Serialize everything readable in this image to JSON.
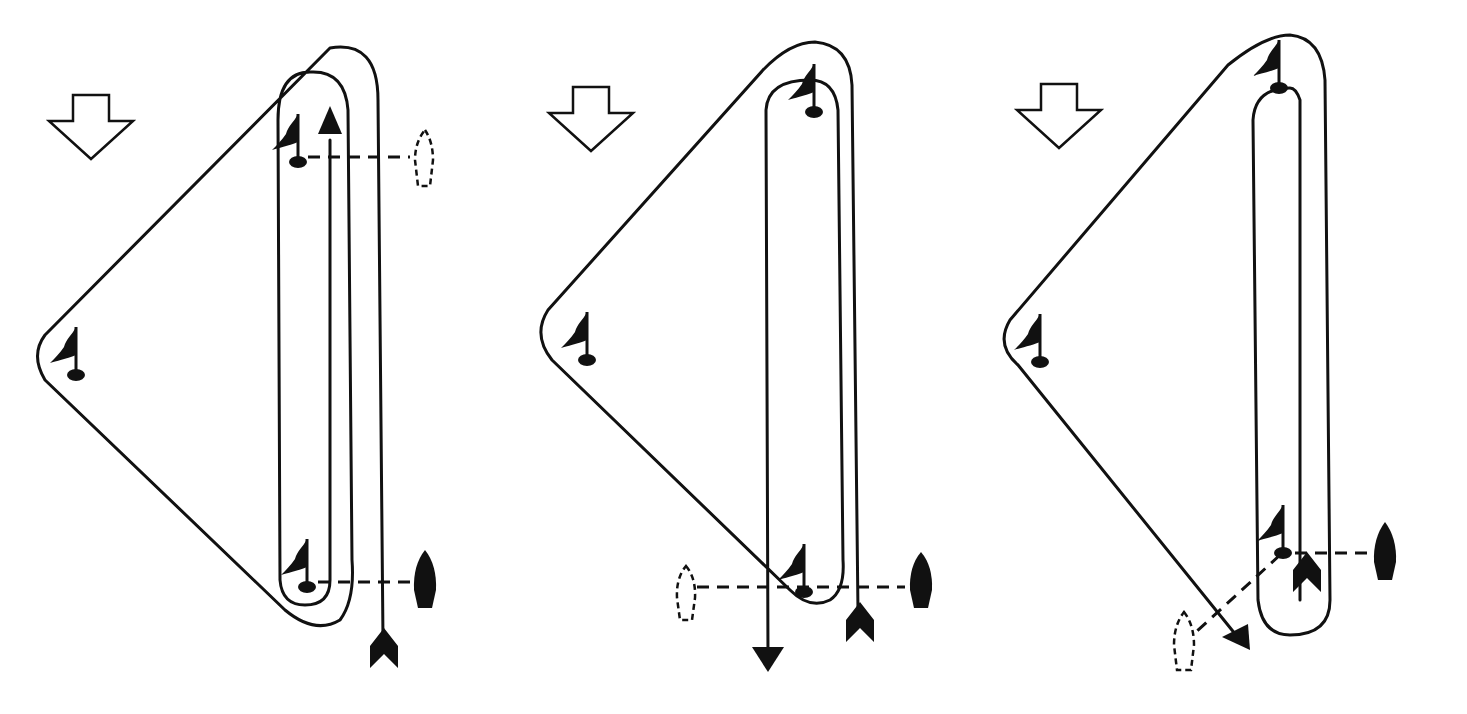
{
  "diagram": {
    "type": "sailing race course diagrams",
    "panel_count": 3,
    "colors": {
      "ink": "#111111",
      "background": "#ffffff"
    },
    "panels": [
      {
        "id": "course-1",
        "wind_arrow": "down",
        "marks": [
          "windward-top",
          "wing-left",
          "leeward-bottom"
        ],
        "start_line": "bottom, committee boat right (solid)",
        "finish_line": "top, finish boat right (dashed outline)",
        "start_arrow": "chevron at bottom right",
        "finish_arrow": "arrowhead up at top"
      },
      {
        "id": "course-2",
        "wind_arrow": "down",
        "marks": [
          "windward-top",
          "wing-left",
          "leeward-bottom"
        ],
        "start_line": "bottom, committee boat right (solid), pin boat left (dashed outline)",
        "finish_line": "bottom, crossing start line",
        "start_arrow": "chevron at bottom right",
        "finish_arrow": "arrowhead down at bottom"
      },
      {
        "id": "course-3",
        "wind_arrow": "down",
        "marks": [
          "windward-top",
          "wing-left",
          "leeward-bottom"
        ],
        "start_line": "bottom right, committee boat right (solid)",
        "finish_line": "angled dashed line to outline boat bottom left",
        "start_arrow": "chevron inside loop bottom",
        "finish_arrow": "arrowhead diagonal down-right"
      }
    ]
  }
}
